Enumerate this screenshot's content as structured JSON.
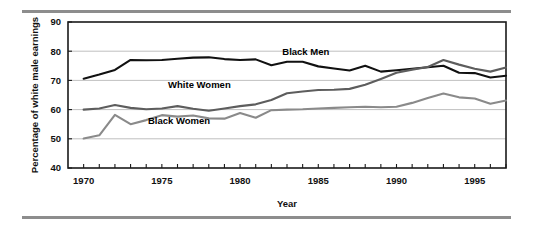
{
  "figure": {
    "background_color": "#ffffff",
    "rule_color": "#8d8d8d",
    "frame_color": "#1a1a1a",
    "grid_color": "#b9b9b9"
  },
  "chart_data": {
    "type": "line",
    "title": "",
    "xlabel": "Year",
    "ylabel": "Percentage of white male earnings",
    "xlim": [
      1969,
      1997
    ],
    "ylim": [
      40,
      90
    ],
    "grid": true,
    "legend_position": "inline-annotations",
    "y_ticks": [
      40,
      50,
      60,
      70,
      80,
      90
    ],
    "x_ticks": [
      1970,
      1971,
      1972,
      1973,
      1974,
      1975,
      1976,
      1977,
      1978,
      1979,
      1980,
      1981,
      1982,
      1983,
      1984,
      1985,
      1986,
      1987,
      1988,
      1989,
      1990,
      1991,
      1992,
      1993,
      1994,
      1995,
      1996,
      1997
    ],
    "x_tick_labels": [
      1970,
      1975,
      1980,
      1985,
      1990,
      1995
    ],
    "x": [
      1970,
      1971,
      1972,
      1973,
      1974,
      1975,
      1976,
      1977,
      1978,
      1979,
      1980,
      1981,
      1982,
      1983,
      1984,
      1985,
      1986,
      1987,
      1988,
      1989,
      1990,
      1991,
      1992,
      1993,
      1994,
      1995,
      1996,
      1997
    ],
    "series": [
      {
        "name": "Black Men",
        "color": "#111111",
        "label_x": 1984.2,
        "label_y": 78.6,
        "values": [
          70.6,
          72.0,
          73.6,
          77.0,
          76.9,
          77.0,
          77.4,
          77.8,
          77.9,
          77.3,
          77.0,
          77.2,
          75.2,
          76.4,
          76.4,
          74.8,
          74.1,
          73.4,
          75.0,
          73.0,
          73.5,
          74.0,
          74.5,
          75.0,
          72.6,
          72.5,
          71.0,
          71.6
        ]
      },
      {
        "name": "White Women",
        "color": "#5d5d5d",
        "label_x": 1977.4,
        "label_y": 67.3,
        "values": [
          60.0,
          60.4,
          61.6,
          60.6,
          60.1,
          60.4,
          61.2,
          60.3,
          59.6,
          60.4,
          61.2,
          61.8,
          63.3,
          65.6,
          66.2,
          66.7,
          66.8,
          67.1,
          68.5,
          70.5,
          72.6,
          73.7,
          74.6,
          77.0,
          75.4,
          74.0,
          73.0,
          74.4
        ]
      },
      {
        "name": "Black Women",
        "color": "#8a8a8a",
        "label_x": 1976.1,
        "label_y": 55.1,
        "values": [
          50.1,
          51.2,
          58.2,
          55.0,
          56.4,
          58.1,
          57.6,
          58.0,
          57.0,
          56.9,
          58.8,
          57.2,
          59.8,
          60.0,
          60.1,
          60.4,
          60.6,
          60.8,
          61.0,
          60.8,
          61.0,
          62.3,
          64.0,
          65.5,
          64.2,
          63.8,
          62.0,
          63.1
        ]
      }
    ]
  }
}
